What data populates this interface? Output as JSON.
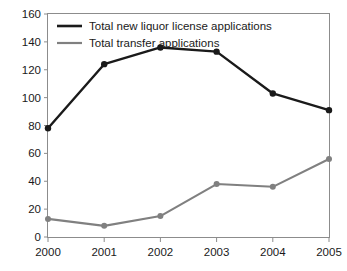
{
  "chart_data": {
    "type": "line",
    "title": "",
    "xlabel": "",
    "ylabel": "",
    "categories": [
      "2000",
      "2001",
      "2002",
      "2003",
      "2004",
      "2005"
    ],
    "x": [
      2000,
      2001,
      2002,
      2003,
      2004,
      2005
    ],
    "ylim": [
      0,
      160
    ],
    "xlim": [
      2000,
      2005
    ],
    "yticks": [
      0,
      20,
      40,
      60,
      80,
      100,
      120,
      140,
      160
    ],
    "ytick_labels": [
      "0",
      "20",
      "40",
      "60",
      "80",
      "100",
      "120",
      "140",
      "160"
    ],
    "xtick_labels": [
      "2000",
      "2001",
      "2002",
      "2003",
      "2004",
      "2005"
    ],
    "grid": false,
    "legend_position": "top-left-inside",
    "series": [
      {
        "name": "Total new liquor license applications",
        "color": "#1a1a1a",
        "marker": "circle",
        "values": [
          78,
          124,
          136,
          133,
          103,
          91
        ]
      },
      {
        "name": "Total transfer applications",
        "color": "#808080",
        "marker": "circle",
        "values": [
          13,
          8,
          15,
          38,
          36,
          56
        ]
      }
    ]
  },
  "legend": {
    "items": [
      {
        "label": "Total new liquor license applications",
        "color": "#1a1a1a"
      },
      {
        "label": "Total transfer applications",
        "color": "#808080"
      }
    ]
  },
  "axes": {
    "y_labels": [
      "160",
      "140",
      "120",
      "100",
      "80",
      "60",
      "40",
      "20",
      "0"
    ],
    "x_labels": [
      "2000",
      "2001",
      "2002",
      "2003",
      "2004",
      "2005"
    ]
  },
  "colors": {
    "series_primary": "#1a1a1a",
    "series_secondary": "#808080",
    "axis": "#8c8c8c",
    "text": "#1a1a1a",
    "background": "#ffffff"
  }
}
